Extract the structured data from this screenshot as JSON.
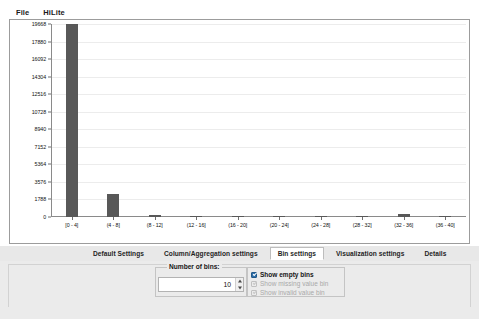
{
  "menubar": {
    "items": [
      {
        "label": "File",
        "name": "menu-file"
      },
      {
        "label": "HiLite",
        "name": "menu-hilite"
      }
    ]
  },
  "chart_data": {
    "type": "bar",
    "title": "",
    "xlabel": "",
    "ylabel": "",
    "grid": true,
    "legend": "none",
    "ylim": [
      0,
      19668
    ],
    "yticks": [
      0,
      1788,
      3576,
      5364,
      7152,
      8940,
      10728,
      12516,
      14304,
      16092,
      17880,
      19668
    ],
    "ytick_labels": [
      "0",
      "1788",
      "3576",
      "5364",
      "7152",
      "8940",
      "10728",
      "12516",
      "14304",
      "16092",
      "17880",
      "19668"
    ],
    "categories": [
      "[0 - 4]",
      "(4 - 8]",
      "(8 - 12]",
      "(12 - 16]",
      "(16 - 20]",
      "(20 - 24]",
      "(24 - 28]",
      "(28 - 32]",
      "(32 - 36]",
      "(36 - 40]"
    ],
    "values": [
      19668,
      2350,
      180,
      90,
      70,
      60,
      55,
      50,
      330,
      95
    ],
    "bar_color": "#585858"
  },
  "tabs": {
    "items": [
      {
        "label": "Default Settings",
        "name": "tab-default-settings",
        "selected": false
      },
      {
        "label": "Column/Aggregation settings",
        "name": "tab-column-aggregation-settings",
        "selected": false
      },
      {
        "label": "Bin settings",
        "name": "tab-bin-settings",
        "selected": true
      },
      {
        "label": "Visualization settings",
        "name": "tab-visualization-settings",
        "selected": false
      },
      {
        "label": "Details",
        "name": "tab-details",
        "selected": false
      }
    ]
  },
  "settings": {
    "bins_group_label": "Number of bins:",
    "bins_value": "10",
    "checkboxes": [
      {
        "label": "Show empty bins",
        "checked": true,
        "disabled": false,
        "name": "checkbox-show-empty-bins"
      },
      {
        "label": "Show missing value bin",
        "checked": true,
        "disabled": true,
        "name": "checkbox-show-missing-value-bin"
      },
      {
        "label": "Show invalid value bin",
        "checked": true,
        "disabled": true,
        "name": "checkbox-show-invalid-value-bin"
      }
    ]
  }
}
